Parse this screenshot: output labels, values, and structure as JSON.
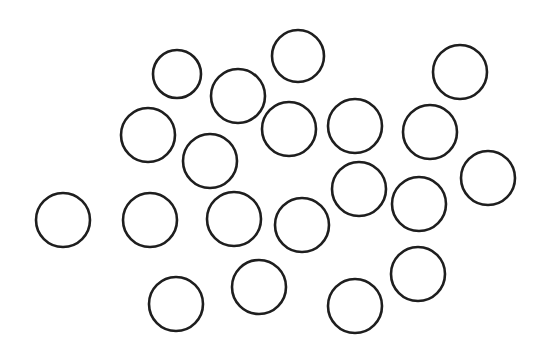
{
  "canvas": {
    "width": 544,
    "height": 356,
    "background": "#ffffff"
  },
  "style": {
    "stroke": "#1e1e1e",
    "stroke_width": 2.6
  },
  "circles": [
    {
      "cx": 177,
      "cy": 74,
      "r": 24
    },
    {
      "cx": 298,
      "cy": 56,
      "r": 26
    },
    {
      "cx": 460,
      "cy": 72,
      "r": 27
    },
    {
      "cx": 238,
      "cy": 96,
      "r": 27
    },
    {
      "cx": 148,
      "cy": 135,
      "r": 27
    },
    {
      "cx": 289,
      "cy": 129,
      "r": 27
    },
    {
      "cx": 355,
      "cy": 126,
      "r": 27
    },
    {
      "cx": 430,
      "cy": 132,
      "r": 27
    },
    {
      "cx": 210,
      "cy": 161,
      "r": 27
    },
    {
      "cx": 488,
      "cy": 178,
      "r": 27
    },
    {
      "cx": 359,
      "cy": 189,
      "r": 27
    },
    {
      "cx": 419,
      "cy": 204,
      "r": 27
    },
    {
      "cx": 63,
      "cy": 220,
      "r": 27
    },
    {
      "cx": 150,
      "cy": 220,
      "r": 27
    },
    {
      "cx": 234,
      "cy": 219,
      "r": 27
    },
    {
      "cx": 302,
      "cy": 225,
      "r": 27
    },
    {
      "cx": 259,
      "cy": 287,
      "r": 27
    },
    {
      "cx": 418,
      "cy": 274,
      "r": 27
    },
    {
      "cx": 176,
      "cy": 304,
      "r": 27
    },
    {
      "cx": 355,
      "cy": 306,
      "r": 27
    }
  ]
}
